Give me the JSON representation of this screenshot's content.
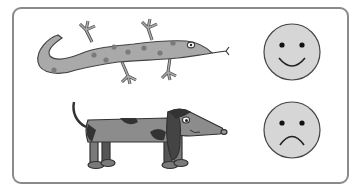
{
  "figure": {
    "items": [
      {
        "name": "lizard",
        "position": "top-left"
      },
      {
        "name": "dog",
        "position": "bottom-left"
      },
      {
        "name": "happy-face",
        "position": "top-right"
      },
      {
        "name": "sad-face",
        "position": "bottom-right"
      }
    ],
    "colors": {
      "frame": "#8a8a8a",
      "lizard_body": "#a9a9a9",
      "lizard_spots": "#7a7a7a",
      "dog_body": "#8c8c8c",
      "dog_spots": "#3a3a3a",
      "face_fill": "#d6d6d6",
      "outline": "#444444"
    }
  }
}
